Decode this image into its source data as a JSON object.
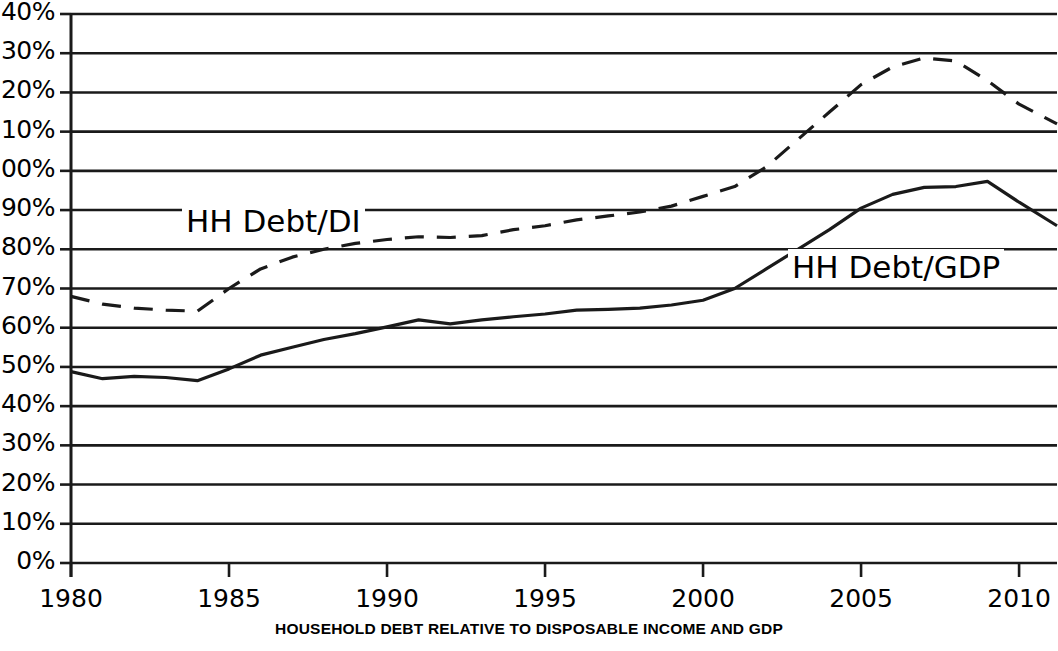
{
  "caption": "HOUSEHOLD DEBT RELATIVE TO DISPOSABLE INCOME AND GDP",
  "labels": {
    "debt_di": "HH Debt/DI",
    "debt_gdp": "HH Debt/GDP"
  },
  "colors": {
    "line": "#1a1a1a",
    "grid": "#1a1a1a",
    "background": "#ffffff"
  },
  "chart_data": {
    "type": "line",
    "title": "",
    "subtitle": "",
    "caption": "HOUSEHOLD DEBT RELATIVE TO DISPOSABLE INCOME AND GDP",
    "xlabel": "",
    "ylabel": "",
    "xlim": [
      1980,
      2011.2
    ],
    "ylim": [
      0,
      140
    ],
    "grid": true,
    "grid_axis": "y",
    "legend": "inline-annotation",
    "y_tick_labels": [
      "0%",
      "10%",
      "20%",
      "30%",
      "40%",
      "50%",
      "60%",
      "70%",
      "80%",
      "90%",
      "100%",
      "110%",
      "120%",
      "130%",
      "140%"
    ],
    "y_ticks": [
      0,
      10,
      20,
      30,
      40,
      50,
      60,
      70,
      80,
      90,
      100,
      110,
      120,
      130,
      140
    ],
    "x_tick_labels": [
      "1980",
      "1985",
      "1990",
      "1995",
      "2000",
      "2005",
      "2010"
    ],
    "x_ticks": [
      1980,
      1985,
      1990,
      1995,
      2000,
      2005,
      2010
    ],
    "x": [
      1980,
      1981,
      1982,
      1983,
      1984,
      1985,
      1986,
      1987,
      1988,
      1989,
      1990,
      1991,
      1992,
      1993,
      1994,
      1995,
      1996,
      1997,
      1998,
      1999,
      2000,
      2001,
      2002,
      2003,
      2004,
      2005,
      2006,
      2007,
      2008,
      2009,
      2010,
      2011.2
    ],
    "series": [
      {
        "name": "HH Debt/DI",
        "style": "dashed",
        "values": [
          68.0,
          66.0,
          65.0,
          64.5,
          64.2,
          70.0,
          75.0,
          78.0,
          80.0,
          81.5,
          82.5,
          83.2,
          83.0,
          83.5,
          85.0,
          86.0,
          87.5,
          88.5,
          89.5,
          91.0,
          93.5,
          96.0,
          101.0,
          108.0,
          115.0,
          122.0,
          126.5,
          128.8,
          128.0,
          123.0,
          117.0,
          112.0
        ]
      },
      {
        "name": "HH Debt/GDP",
        "style": "solid",
        "values": [
          48.8,
          47.0,
          47.6,
          47.3,
          46.5,
          49.5,
          53.0,
          55.0,
          57.0,
          58.5,
          60.2,
          62.0,
          61.0,
          62.0,
          62.8,
          63.5,
          64.5,
          64.7,
          65.0,
          65.8,
          67.0,
          70.0,
          75.0,
          80.0,
          85.0,
          90.5,
          94.0,
          95.8,
          96.0,
          97.3,
          92.0,
          86.0
        ]
      }
    ]
  }
}
